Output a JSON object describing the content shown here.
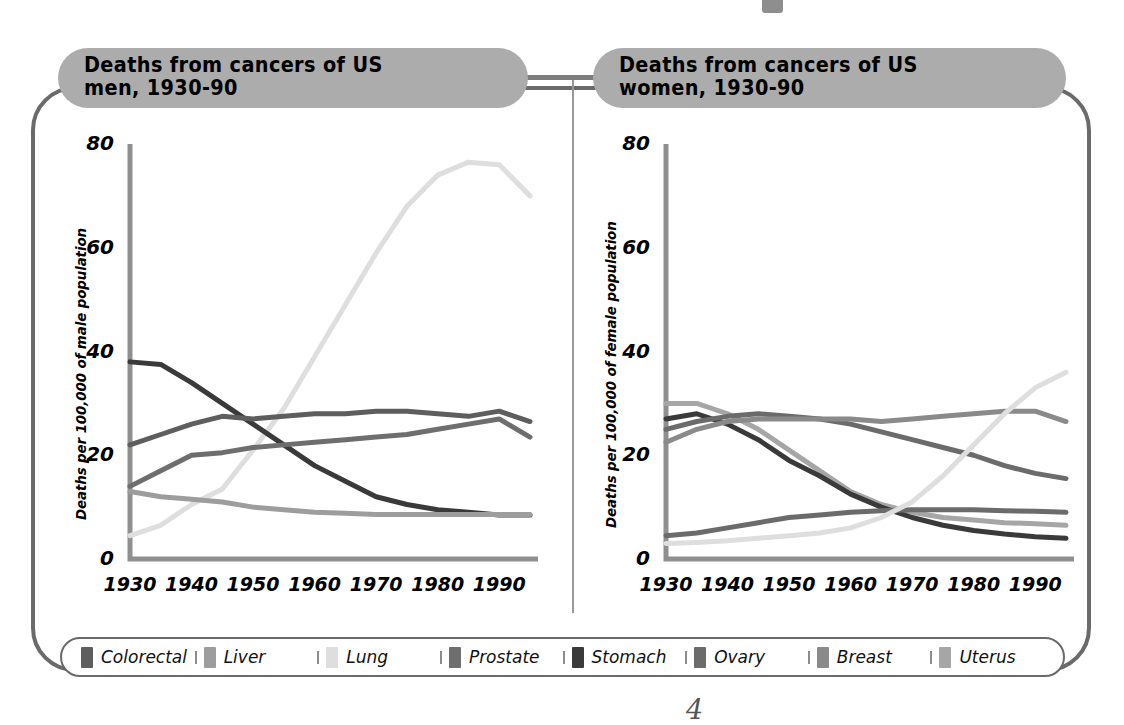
{
  "figure": {
    "page_mark": "4",
    "divider_color": "#9a9a9a",
    "frame_color": "#6a6a6a"
  },
  "palette": {
    "colorectal": "#5e5e5e",
    "liver": "#9d9d9d",
    "lung": "#dedede",
    "prostate": "#6e6e6e",
    "stomach": "#3a3a3a",
    "ovary": "#6b6b6b",
    "breast": "#8a8a8a",
    "uterus": "#a6a6a6"
  },
  "legend": {
    "items": [
      {
        "label": "Colorectal",
        "color": "#5e5e5e",
        "swatch": "colorectal-swatch"
      },
      {
        "label": "Liver",
        "color": "#9d9d9d",
        "swatch": "liver-swatch"
      },
      {
        "label": "Lung",
        "color": "#dedede",
        "swatch": "lung-swatch"
      },
      {
        "label": "Prostate",
        "color": "#6e6e6e",
        "swatch": "prostate-swatch"
      },
      {
        "label": "Stomach",
        "color": "#3a3a3a",
        "swatch": "stomach-swatch"
      },
      {
        "label": "Ovary",
        "color": "#6b6b6b",
        "swatch": "ovary-swatch"
      },
      {
        "label": "Breast",
        "color": "#8a8a8a",
        "swatch": "breast-swatch"
      },
      {
        "label": "Uterus",
        "color": "#a6a6a6",
        "swatch": "uterus-swatch"
      }
    ]
  },
  "chart_data": [
    {
      "id": "men",
      "type": "line",
      "title": "Deaths from cancers of US\nmen, 1930-90",
      "xlabel": "",
      "ylabel": "Deaths per 100,000 of male population",
      "xlim": [
        1930,
        1995
      ],
      "ylim": [
        0,
        80
      ],
      "yticks": [
        0,
        20,
        40,
        60,
        80
      ],
      "xticks": [
        1930,
        1940,
        1950,
        1960,
        1970,
        1980,
        1990
      ],
      "grid": false,
      "legend_position": "bottom-shared",
      "x": [
        1930,
        1935,
        1940,
        1945,
        1950,
        1955,
        1960,
        1965,
        1970,
        1975,
        1980,
        1985,
        1990,
        1995
      ],
      "series": [
        {
          "name": "Lung",
          "color": "#dedede",
          "values": [
            4.5,
            6.5,
            10.5,
            13.5,
            21,
            29,
            39,
            49,
            59,
            68,
            74,
            76.5,
            76,
            70
          ]
        },
        {
          "name": "Stomach",
          "color": "#3a3a3a",
          "values": [
            38,
            37.5,
            34,
            30,
            26,
            22,
            18,
            15,
            12,
            10.5,
            9.5,
            9,
            8.5,
            8.5
          ]
        },
        {
          "name": "Colorectal",
          "color": "#5e5e5e",
          "values": [
            22,
            24,
            26,
            27.5,
            27,
            27.5,
            28,
            28,
            28.5,
            28.5,
            28,
            27.5,
            28.5,
            26.5
          ]
        },
        {
          "name": "Prostate",
          "color": "#6e6e6e",
          "values": [
            14,
            17,
            20,
            20.5,
            21.5,
            22,
            22.5,
            23,
            23.5,
            24,
            25,
            26,
            27,
            23.5
          ]
        },
        {
          "name": "Liver",
          "color": "#9d9d9d",
          "values": [
            13,
            12,
            11.5,
            11,
            10,
            9.5,
            9,
            8.8,
            8.6,
            8.6,
            8.6,
            8.6,
            8.6,
            8.6
          ]
        }
      ]
    },
    {
      "id": "women",
      "type": "line",
      "title": "Deaths from cancers of US\nwomen, 1930-90",
      "xlabel": "",
      "ylabel": "Deaths per 100,000 of female population",
      "xlim": [
        1930,
        1995
      ],
      "ylim": [
        0,
        80
      ],
      "yticks": [
        0,
        20,
        40,
        60,
        80
      ],
      "xticks": [
        1930,
        1940,
        1950,
        1960,
        1970,
        1980,
        1990
      ],
      "grid": false,
      "legend_position": "bottom-shared",
      "x": [
        1930,
        1935,
        1940,
        1945,
        1950,
        1955,
        1960,
        1965,
        1970,
        1975,
        1980,
        1985,
        1990,
        1995
      ],
      "series": [
        {
          "name": "Uterus",
          "color": "#a6a6a6",
          "values": [
            30,
            30,
            28,
            25,
            21,
            17,
            13,
            10.5,
            9,
            8,
            7.5,
            7,
            6.8,
            6.5
          ]
        },
        {
          "name": "Stomach",
          "color": "#3a3a3a",
          "values": [
            27,
            28,
            26,
            23,
            19,
            16,
            12.5,
            10,
            8,
            6.5,
            5.5,
            4.8,
            4.3,
            4
          ]
        },
        {
          "name": "Colorectal",
          "color": "#6b6b6b",
          "values": [
            25,
            26.5,
            27.5,
            28,
            27.5,
            27,
            26,
            24.5,
            23,
            21.5,
            20,
            18,
            16.5,
            15.5
          ]
        },
        {
          "name": "Breast",
          "color": "#8a8a8a",
          "values": [
            22.5,
            25,
            26.5,
            27,
            27,
            27,
            27,
            26.5,
            27,
            27.5,
            28,
            28.5,
            28.5,
            26.5
          ]
        },
        {
          "name": "Ovary",
          "color": "#6b6b6b",
          "values": [
            4.5,
            5,
            6,
            7,
            8,
            8.5,
            9,
            9.3,
            9.5,
            9.5,
            9.5,
            9.3,
            9.2,
            9
          ]
        },
        {
          "name": "Lung",
          "color": "#dedede",
          "values": [
            3,
            3.2,
            3.5,
            4,
            4.5,
            5,
            6,
            8,
            11,
            16,
            22,
            28,
            33,
            36
          ]
        }
      ]
    }
  ]
}
